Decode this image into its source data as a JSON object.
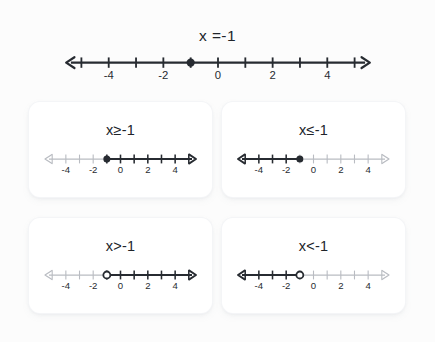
{
  "page": {
    "background_color": "#fcfcfc",
    "ink_color": "#272b31",
    "muted_color": "#b9bcc2",
    "card_background": "#ffffff"
  },
  "header": {
    "title": "x =-1",
    "number_line": {
      "dot_value": -1,
      "dot_style": "filled",
      "tick_labels": [
        "-4",
        "-2",
        "0",
        "2",
        "4"
      ],
      "tick_label_values": [
        -4,
        -2,
        0,
        2,
        4
      ],
      "min": -5.6,
      "max": 5.6,
      "tick_min": -5,
      "tick_max": 5,
      "left_arrow_color": "#272b31",
      "right_arrow_color": "#272b31",
      "shaded_direction": "none"
    }
  },
  "cards": [
    {
      "id": "card-greater-equal",
      "title": "x≥-1",
      "relation": "greater-or-equal",
      "number_line": {
        "dot_value": -1,
        "dot_style": "filled",
        "tick_labels": [
          "-4",
          "-2",
          "0",
          "2",
          "4"
        ],
        "tick_label_values": [
          -4,
          -2,
          0,
          2,
          4
        ],
        "min": -5.6,
        "max": 5.6,
        "tick_min": -5,
        "tick_max": 5,
        "left_arrow_color": "#b9bcc2",
        "right_arrow_color": "#272b31",
        "shaded_direction": "right"
      }
    },
    {
      "id": "card-less-equal",
      "title": "x≤-1",
      "relation": "less-or-equal",
      "number_line": {
        "dot_value": -1,
        "dot_style": "filled",
        "tick_labels": [
          "-4",
          "-2",
          "0",
          "2",
          "4"
        ],
        "tick_label_values": [
          -4,
          -2,
          0,
          2,
          4
        ],
        "min": -5.6,
        "max": 5.6,
        "tick_min": -5,
        "tick_max": 5,
        "left_arrow_color": "#272b31",
        "right_arrow_color": "#b9bcc2",
        "shaded_direction": "left"
      }
    },
    {
      "id": "card-greater",
      "title": "x>-1",
      "relation": "greater-than",
      "number_line": {
        "dot_value": -1,
        "dot_style": "open",
        "tick_labels": [
          "-4",
          "-2",
          "0",
          "2",
          "4"
        ],
        "tick_label_values": [
          -4,
          -2,
          0,
          2,
          4
        ],
        "min": -5.6,
        "max": 5.6,
        "tick_min": -5,
        "tick_max": 5,
        "left_arrow_color": "#b9bcc2",
        "right_arrow_color": "#272b31",
        "shaded_direction": "right"
      }
    },
    {
      "id": "card-less",
      "title": "x<-1",
      "relation": "less-than",
      "number_line": {
        "dot_value": -1,
        "dot_style": "open",
        "tick_labels": [
          "-4",
          "-2",
          "0",
          "2",
          "4"
        ],
        "tick_label_values": [
          -4,
          -2,
          0,
          2,
          4
        ],
        "min": -5.6,
        "max": 5.6,
        "tick_min": -5,
        "tick_max": 5,
        "left_arrow_color": "#272b31",
        "right_arrow_color": "#b9bcc2",
        "shaded_direction": "left"
      }
    }
  ]
}
